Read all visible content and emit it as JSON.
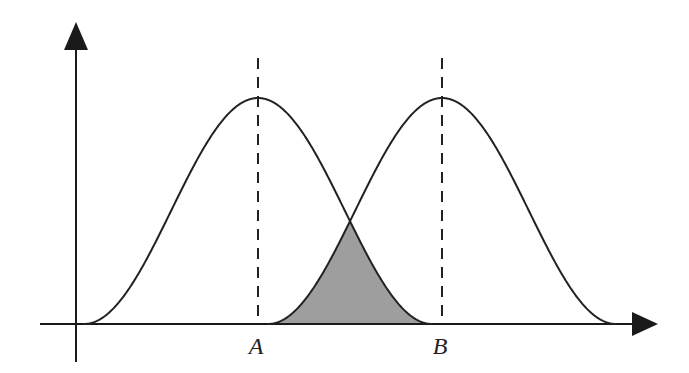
{
  "chart_data": {
    "type": "diagram",
    "title": "",
    "axes": {
      "x_arrow": true,
      "y_arrow": true,
      "xlabel": "",
      "ylabel": ""
    },
    "distributions": [
      {
        "name": "left-distribution",
        "center_label": "A",
        "center": 0
      },
      {
        "name": "right-distribution",
        "center_label": "B",
        "center": 1
      }
    ],
    "markers": [
      {
        "label": "A",
        "value": 0,
        "style": "dashed-vertical"
      },
      {
        "label": "B",
        "value": 1,
        "style": "dashed-vertical"
      }
    ],
    "shaded_region": {
      "description": "overlap of the two curves (min of both) between A and B",
      "color": "#9e9e9e"
    },
    "colors": {
      "line": "#222222",
      "fill": "#9e9e9e",
      "background": "#ffffff"
    }
  },
  "labels": {
    "a": "A",
    "b": "B"
  }
}
